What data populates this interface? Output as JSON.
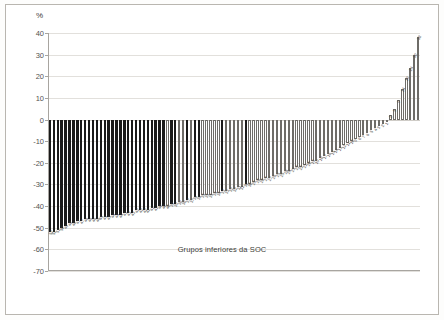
{
  "figure": {
    "unit_label": "%",
    "xlabel": "Grupos inferiores da SOC",
    "frame_color": "#b9b6b0",
    "grid_color": "#e2e0dc",
    "axis_color": "#a8a5a0",
    "bar_dark_color": "#1a1a1a",
    "bar_light_color": "#ffffff",
    "bar_outline_color": "#6e6c68"
  },
  "chart_data": {
    "type": "bar",
    "title": "",
    "subtitle": "",
    "xlabel": "Grupos inferiores da SOC",
    "ylabel": "%",
    "unit": "%",
    "ylim": [
      -70,
      40
    ],
    "yticks": [
      40,
      30,
      20,
      10,
      0,
      -10,
      -20,
      -30,
      -40,
      -50,
      -60,
      -70
    ],
    "ytick_labels": [
      "40",
      "30",
      "20",
      "10",
      "0",
      "-10",
      "-20",
      "-30",
      "-40",
      "-50",
      "-60",
      "-70"
    ],
    "grid": "horizontal",
    "legend": "none",
    "sorted": "ascending",
    "n_bars": 95,
    "categories": [
      "52",
      "52",
      "51",
      "50",
      "49",
      "48",
      "48",
      "47",
      "47",
      "46",
      "46",
      "46",
      "46",
      "45",
      "45",
      "45",
      "44",
      "44",
      "44",
      "43",
      "43",
      "43",
      "42",
      "42",
      "42",
      "42",
      "41",
      "41",
      "40",
      "40",
      "40",
      "39",
      "39",
      "38",
      "38",
      "37",
      "37",
      "36",
      "36",
      "35",
      "35",
      "35",
      "34",
      "34",
      "33",
      "33",
      "32",
      "32",
      "31",
      "31",
      "30",
      "30",
      "29",
      "28",
      "28",
      "27",
      "27",
      "26",
      "25",
      "25",
      "24",
      "24",
      "23",
      "22",
      "22",
      "21",
      "20",
      "19",
      "19",
      "18",
      "17",
      "16",
      "15",
      "14",
      "13",
      "12",
      "11",
      "10",
      "9",
      "8",
      "7",
      "6",
      "5",
      "4",
      "3",
      "2",
      "1",
      "2",
      "5",
      "9",
      "14",
      "19",
      "24",
      "30",
      "38"
    ],
    "values": [
      -52,
      -52,
      -51,
      -50,
      -49,
      -48,
      -48,
      -47,
      -47,
      -46,
      -46,
      -46,
      -46,
      -45,
      -45,
      -45,
      -44,
      -44,
      -44,
      -43,
      -43,
      -43,
      -42,
      -42,
      -42,
      -42,
      -41,
      -41,
      -40,
      -40,
      -40,
      -39,
      -39,
      -38,
      -38,
      -37,
      -37,
      -36,
      -36,
      -35,
      -35,
      -35,
      -34,
      -34,
      -33,
      -33,
      -32,
      -32,
      -31,
      -31,
      -30,
      -30,
      -29,
      -28,
      -28,
      -27,
      -27,
      -26,
      -25,
      -25,
      -24,
      -24,
      -23,
      -22,
      -22,
      -21,
      -20,
      -19,
      -19,
      -18,
      -17,
      -16,
      -15,
      -14,
      -13,
      -12,
      -11,
      -10,
      -9,
      -8,
      -7,
      -6,
      -5,
      -4,
      -3,
      -2,
      -1,
      2,
      5,
      9,
      14,
      19,
      24,
      30,
      38
    ],
    "shades": [
      1,
      1,
      1,
      1,
      1,
      1,
      1,
      1,
      1,
      1,
      1,
      1,
      1,
      1,
      1,
      1,
      1,
      1,
      1,
      1,
      1,
      1,
      1,
      1,
      1,
      1,
      1,
      1,
      1,
      1,
      0,
      1,
      1,
      0,
      0,
      1,
      0,
      1,
      1,
      0,
      0,
      0,
      0,
      0,
      1,
      0,
      0,
      0,
      0,
      0,
      1,
      0,
      0,
      0,
      0,
      0,
      0,
      0,
      0,
      0,
      0,
      0,
      0,
      0,
      0,
      0,
      0,
      0,
      0,
      0,
      0,
      0,
      0,
      0,
      0,
      0,
      0,
      0,
      0,
      0,
      0,
      0,
      0,
      0,
      0,
      0,
      0,
      0,
      0,
      0,
      0,
      0,
      0,
      0,
      0
    ]
  }
}
